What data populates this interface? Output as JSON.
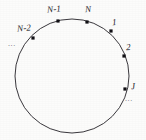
{
  "figure": {
    "kind": "circle-index-diagram",
    "background_color": "#fcfcfb",
    "stroke_color": "#3a383d",
    "node_color": "#111014",
    "label_color": "#26242a",
    "ellipsis_color": "#6d6a70"
  },
  "chart_data": {
    "type": "scatter",
    "title": "",
    "subtitle": "",
    "xlabel": "",
    "ylabel": "",
    "grid": false,
    "legend": null,
    "circle": {
      "center_x": 72,
      "center_y": 76,
      "radius": 57,
      "stroke_width": 1
    },
    "annotations": [
      {
        "text": "...",
        "x": 8,
        "y": 40
      },
      {
        "text": "...",
        "x": 125,
        "y": 95
      }
    ],
    "points": [
      {
        "label": "N-2",
        "x": 33,
        "y": 38,
        "label_x": 17,
        "label_y": 24
      },
      {
        "label": "N-1",
        "x": 58,
        "y": 21,
        "label_x": 47,
        "label_y": 5
      },
      {
        "label": "N",
        "x": 87,
        "y": 22,
        "label_x": 85,
        "label_y": 5
      },
      {
        "label": "1",
        "x": 111,
        "y": 31,
        "label_x": 112,
        "label_y": 18
      },
      {
        "label": "2",
        "x": 124,
        "y": 56,
        "label_x": 126,
        "label_y": 43
      },
      {
        "label": "J",
        "x": 125,
        "y": 89,
        "label_x": 131,
        "label_y": 82
      }
    ]
  }
}
